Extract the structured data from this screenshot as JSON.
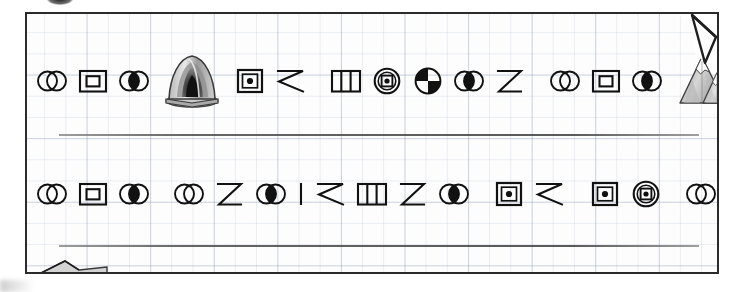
{
  "page": {
    "background_color": "#ffffff",
    "paper_color": "#fdfdfd",
    "grid_color": "#7d8caa",
    "ink_color": "#111111",
    "rule_color": "#3d3d3d"
  },
  "sheet": {
    "ruled_lines": 2,
    "corner_fold": "top-right-dogear",
    "torn_flap": "bottom-left"
  },
  "glyph_legend": {
    "circles-outline": "two overlapping outline circles",
    "square-in-square": "square inside a square",
    "circles-lens-filled": "two overlapping circles with filled lens",
    "square-dot": "nested squares with center dot",
    "zigzag-z": "angular Z / zigzag stroke",
    "three-bars": "rectangle divided into three vertical bars",
    "circle-square-dot": "circle containing nested square and dot",
    "quartered-circle": "circle split in quarters, opposite quarters filled",
    "vertical-bar": "single vertical stroke"
  },
  "lines": [
    {
      "id": "line-1",
      "words": [
        {
          "id": "w1-1",
          "glyphs": [
            "circles-outline",
            "square-in-square",
            "circles-lens-filled"
          ]
        },
        {
          "id": "w1-pic-tent",
          "picture": "tent-cave"
        },
        {
          "id": "w1-2",
          "glyphs": [
            "square-dot",
            "zigzag-z"
          ]
        },
        {
          "id": "w1-3",
          "glyphs": [
            "three-bars",
            "circle-square-dot",
            "quartered-circle",
            "circles-lens-filled",
            "zigzag-z"
          ]
        },
        {
          "id": "w1-4",
          "glyphs": [
            "circles-outline",
            "square-in-square",
            "circles-lens-filled"
          ]
        },
        {
          "id": "w1-pic-mtn",
          "picture": "mountain"
        }
      ]
    },
    {
      "id": "line-2",
      "words": [
        {
          "id": "w2-1",
          "glyphs": [
            "circles-outline",
            "square-in-square",
            "circles-lens-filled"
          ]
        },
        {
          "id": "w2-2",
          "glyphs": [
            "circles-outline",
            "zigzag-z",
            "circles-lens-filled",
            "vertical-bar",
            "zigzag-z",
            "three-bars",
            "zigzag-z",
            "circles-lens-filled"
          ]
        },
        {
          "id": "w2-3",
          "glyphs": [
            "square-dot",
            "zigzag-z"
          ]
        },
        {
          "id": "w2-4",
          "glyphs": [
            "square-dot",
            "circle-square-dot"
          ]
        },
        {
          "id": "w2-5",
          "glyphs": [
            "circles-outline",
            "square-in-square",
            "circles-lens-filled"
          ]
        },
        {
          "id": "w2-pic-boat",
          "picture": "boat"
        }
      ]
    }
  ],
  "pictures": {
    "tent-cave": "grayscale tent / cave entrance illustration",
    "mountain": "grayscale snow-capped mountain illustration",
    "boat": "grayscale rowboat with outboard motor illustration"
  }
}
